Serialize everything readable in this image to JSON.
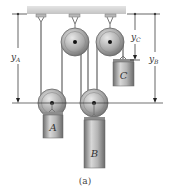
{
  "figure": {
    "caption": "(a)",
    "labels": {
      "yA_main": "y",
      "yA_sub": "A",
      "yB_main": "y",
      "yB_sub": "B",
      "yC_main": "y",
      "yC_sub": "C",
      "block_A": "A",
      "block_B": "B",
      "block_C": "C"
    },
    "colors": {
      "ceiling": "#d6d6d6",
      "pulley": "#a8a8a8",
      "block": "#9a9a9a",
      "cable": "#8a8a8a",
      "dimension_line": "#222222"
    }
  }
}
